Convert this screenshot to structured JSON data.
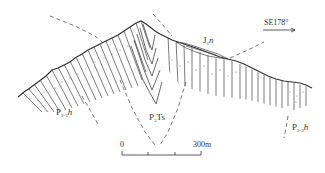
{
  "diagram": {
    "type": "geological-cross-section",
    "orientation": {
      "label": "SE178°",
      "arrow": "right"
    },
    "units": [
      {
        "id": "left",
        "code": "P",
        "sub": "2-3",
        "suffix": "h",
        "display": "P2-3h"
      },
      {
        "id": "core",
        "code": "P",
        "sub": "3",
        "suffix": "Ts",
        "display": "P3Ts"
      },
      {
        "id": "cap",
        "code": "J",
        "sub": "1",
        "suffix": "n",
        "display": "J1n"
      },
      {
        "id": "right",
        "code": "P",
        "sub": "2-3",
        "suffix": "h",
        "display": "P2-3h"
      }
    ],
    "scale_bar": {
      "start_label": "0",
      "end_label": "300m",
      "divisions": 3
    },
    "colors": {
      "line": "#333333",
      "dashed": "#555555",
      "background": "#ffffff"
    }
  }
}
